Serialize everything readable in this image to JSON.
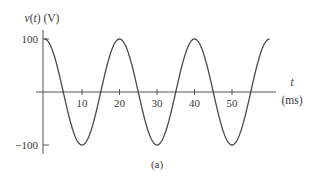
{
  "chart_data": {
    "type": "line",
    "title": "",
    "ylabel": "v(t) (V)",
    "ylabel_parts": {
      "var": "v",
      "arg": "t",
      "unit": "(V)"
    },
    "xlabel": "t",
    "xlabel_unit": "(ms)",
    "caption": "(a)",
    "xlim": [
      0,
      62
    ],
    "ylim": [
      -100,
      100
    ],
    "x_ticks": [
      10,
      20,
      30,
      40,
      50
    ],
    "x_tick_labels": [
      "10",
      "20",
      "30",
      "40",
      "50"
    ],
    "y_ticks": [
      100,
      -100
    ],
    "y_tick_labels": [
      "100",
      "−100"
    ],
    "grid": false,
    "legend": "none",
    "series": [
      {
        "name": "v(t)",
        "function": "100*cos(2*pi*t/20)",
        "amplitude": 100,
        "period_ms": 20,
        "t_start": 0,
        "t_end": 60,
        "x": [
          0,
          5,
          10,
          15,
          20,
          25,
          30,
          35,
          40,
          45,
          50,
          55,
          60
        ],
        "values": [
          100,
          0,
          -100,
          0,
          100,
          0,
          -100,
          0,
          100,
          0,
          -100,
          0,
          100
        ]
      }
    ],
    "colors": {
      "axis": "#555555",
      "curve": "#4a4a4a",
      "text": "#3a3a3a"
    }
  }
}
